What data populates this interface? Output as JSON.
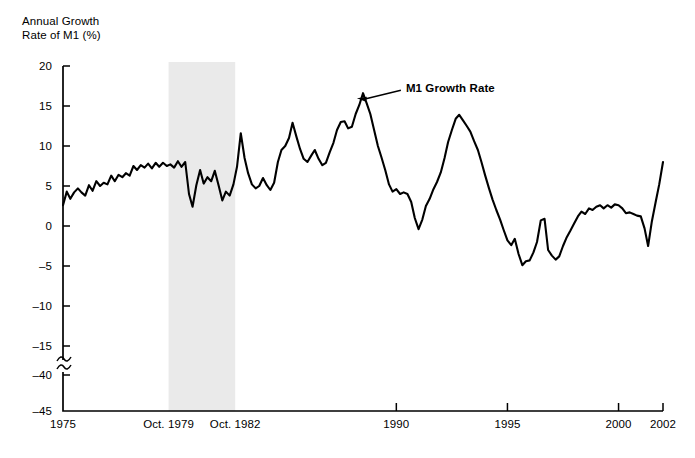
{
  "chart_data": {
    "type": "line",
    "title": "Annual Growth Rate of M1 (%)",
    "ylabel": "Annual Growth\nRate of M1 (%)",
    "xlabel": "",
    "grid": false,
    "legend_position": "inline-annotation",
    "xlim": [
      1975,
      2002
    ],
    "ylim": [
      -45,
      20
    ],
    "y_ticks": [
      20,
      15,
      10,
      5,
      0,
      -5,
      -10,
      -15,
      -40,
      -45
    ],
    "y_tick_labels": [
      "20",
      "15",
      "10",
      "5",
      "0",
      "-5",
      "-10",
      "-15",
      "-40",
      "-45"
    ],
    "y_axis_break": {
      "present": true,
      "between": [
        -15,
        -40
      ],
      "symbol": "squiggle"
    },
    "x_ticks": [
      1975,
      1990,
      1995,
      2000,
      2002
    ],
    "x_tick_labels": [
      "1975",
      "1990",
      "1995",
      "2000",
      "2002"
    ],
    "x_extra_labels": [
      {
        "label": "Oct. 1979",
        "x": 1979.75
      },
      {
        "label": "Oct. 1982",
        "x": 1982.75
      }
    ],
    "shaded_band": {
      "label_start": "Oct. 1979",
      "label_end": "Oct. 1982",
      "x_start": 1979.75,
      "x_end": 1982.75,
      "color": "#eaeaea"
    },
    "annotations": [
      {
        "text": "M1 Growth Rate",
        "x": 1988.0,
        "y": 16.6,
        "arrow": true
      }
    ],
    "series": [
      {
        "name": "M1 Growth Rate",
        "color": "#000000",
        "x": [
          1975.0,
          1975.17,
          1975.33,
          1975.5,
          1975.67,
          1975.83,
          1976.0,
          1976.17,
          1976.33,
          1976.5,
          1976.67,
          1976.83,
          1977.0,
          1977.17,
          1977.33,
          1977.5,
          1977.67,
          1977.83,
          1978.0,
          1978.17,
          1978.33,
          1978.5,
          1978.67,
          1978.83,
          1979.0,
          1979.17,
          1979.33,
          1979.5,
          1979.67,
          1979.83,
          1980.0,
          1980.17,
          1980.33,
          1980.5,
          1980.67,
          1980.83,
          1981.0,
          1981.17,
          1981.33,
          1981.5,
          1981.67,
          1981.83,
          1982.0,
          1982.17,
          1982.33,
          1982.5,
          1982.67,
          1982.83,
          1983.0,
          1983.17,
          1983.33,
          1983.5,
          1983.67,
          1983.83,
          1984.0,
          1984.17,
          1984.33,
          1984.5,
          1984.67,
          1984.83,
          1985.0,
          1985.17,
          1985.33,
          1985.5,
          1985.67,
          1985.83,
          1986.0,
          1986.17,
          1986.33,
          1986.5,
          1986.67,
          1986.83,
          1987.0,
          1987.17,
          1987.33,
          1987.5,
          1987.67,
          1987.83,
          1988.0,
          1988.17,
          1988.33,
          1988.5,
          1988.67,
          1988.83,
          1989.0,
          1989.17,
          1989.33,
          1989.5,
          1989.67,
          1989.83,
          1990.0,
          1990.17,
          1990.33,
          1990.5,
          1990.67,
          1990.83,
          1991.0,
          1991.17,
          1991.33,
          1991.5,
          1991.67,
          1991.83,
          1992.0,
          1992.17,
          1992.33,
          1992.5,
          1992.67,
          1992.83,
          1993.0,
          1993.17,
          1993.33,
          1993.5,
          1993.67,
          1993.83,
          1994.0,
          1994.17,
          1994.33,
          1994.5,
          1994.67,
          1994.83,
          1995.0,
          1995.17,
          1995.33,
          1995.5,
          1995.67,
          1995.83,
          1996.0,
          1996.17,
          1996.33,
          1996.5,
          1996.67,
          1996.83,
          1997.0,
          1997.17,
          1997.33,
          1997.5,
          1997.67,
          1997.83,
          1998.0,
          1998.17,
          1998.33,
          1998.5,
          1998.67,
          1998.83,
          1999.0,
          1999.17,
          1999.33,
          1999.5,
          1999.67,
          1999.83,
          2000.0,
          2000.17,
          2000.33,
          2000.5,
          2000.67,
          2000.83,
          2001.0,
          2001.17,
          2001.33,
          2001.5,
          2001.67,
          2001.83,
          2002.0
        ],
        "y": [
          2.6,
          4.3,
          3.4,
          4.2,
          4.7,
          4.2,
          3.8,
          5.1,
          4.4,
          5.6,
          5.0,
          5.4,
          5.2,
          6.3,
          5.6,
          6.4,
          6.1,
          6.6,
          6.3,
          7.5,
          7.0,
          7.6,
          7.3,
          7.8,
          7.2,
          7.9,
          7.4,
          7.9,
          7.5,
          7.7,
          7.3,
          8.1,
          7.4,
          8.0,
          4.0,
          2.4,
          5.1,
          7.0,
          5.3,
          6.1,
          5.6,
          6.9,
          5.1,
          3.2,
          4.3,
          3.8,
          5.2,
          7.4,
          11.6,
          8.5,
          6.6,
          5.2,
          4.7,
          5.0,
          6.0,
          5.1,
          4.5,
          5.4,
          8.0,
          9.5,
          10.0,
          11.0,
          12.9,
          11.2,
          9.6,
          8.4,
          8.0,
          8.8,
          9.5,
          8.4,
          7.6,
          7.9,
          9.2,
          10.4,
          12.0,
          13.0,
          13.1,
          12.2,
          12.4,
          14.0,
          15.1,
          16.6,
          15.3,
          14.0,
          12.0,
          10.0,
          8.6,
          7.0,
          5.2,
          4.3,
          4.6,
          4.0,
          4.2,
          4.0,
          3.0,
          1.0,
          -0.4,
          0.8,
          2.5,
          3.4,
          4.6,
          5.5,
          6.7,
          8.5,
          10.5,
          12.0,
          13.4,
          13.9,
          13.2,
          12.5,
          11.8,
          10.6,
          9.5,
          8.0,
          6.3,
          4.7,
          3.3,
          2.0,
          0.8,
          -0.5,
          -1.8,
          -2.4,
          -1.6,
          -3.5,
          -4.9,
          -4.4,
          -4.3,
          -3.3,
          -2.0,
          0.7,
          0.9,
          -3.0,
          -3.7,
          -4.2,
          -3.8,
          -2.5,
          -1.4,
          -0.6,
          0.3,
          1.2,
          1.8,
          1.5,
          2.2,
          2.0,
          2.4,
          2.6,
          2.2,
          2.6,
          2.3,
          2.7,
          2.6,
          2.2,
          1.6,
          1.7,
          1.5,
          1.3,
          1.2,
          -0.3,
          -2.5,
          0.6,
          3.0,
          5.2,
          8.0
        ]
      }
    ]
  },
  "axis": {
    "title_text": "Annual Growth\nRate of M1 (%)"
  }
}
